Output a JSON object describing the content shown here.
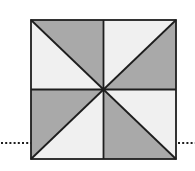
{
  "diagram": {
    "type": "pinwheel-square",
    "square": {
      "x1": 31,
      "y1": 20,
      "x2": 176,
      "y2": 159
    },
    "center": {
      "x": 103.5,
      "y": 89.5
    },
    "dotted_line_y": 143,
    "colors": {
      "dark_fill": "#a9a9a9",
      "light_fill": "#f0f0f0",
      "stroke": "#1e1e1e",
      "dots": "#1e1e1e",
      "background": "#ffffff"
    },
    "triangles": [
      {
        "name": "top-left-upper",
        "shade": "dark"
      },
      {
        "name": "top-left-lower",
        "shade": "light"
      },
      {
        "name": "top-right-upper",
        "shade": "light"
      },
      {
        "name": "top-right-lower",
        "shade": "dark"
      },
      {
        "name": "bottom-left-upper",
        "shade": "dark"
      },
      {
        "name": "bottom-left-lower",
        "shade": "light"
      },
      {
        "name": "bottom-right-upper",
        "shade": "light"
      },
      {
        "name": "bottom-right-lower",
        "shade": "dark"
      }
    ]
  }
}
